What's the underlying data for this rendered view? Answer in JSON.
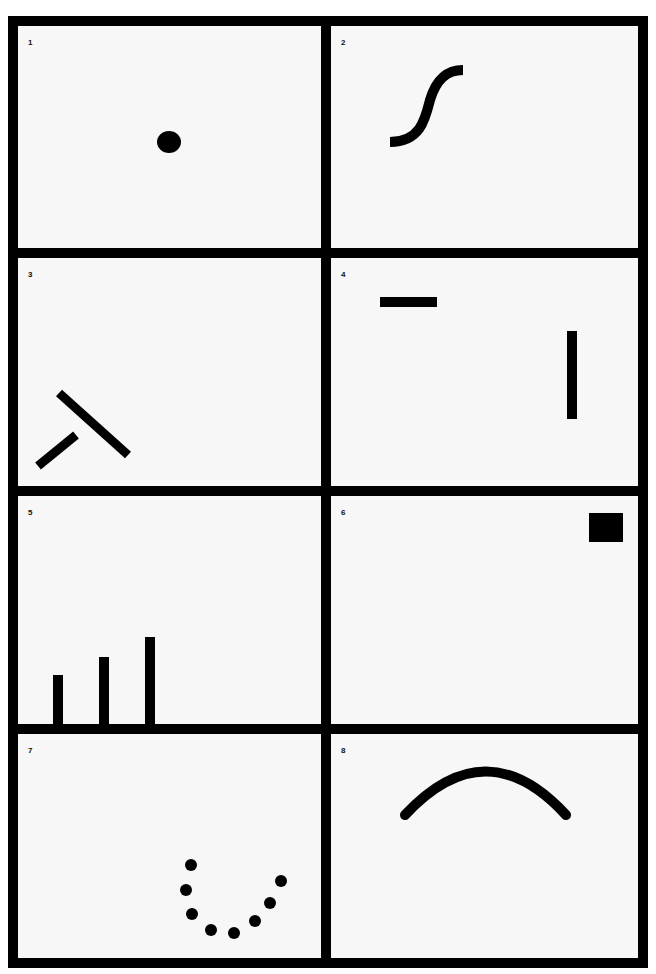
{
  "figure": {
    "background": "#ffffff",
    "frame_color": "#000000",
    "panel_color": "#f7f7f7",
    "ink_color": "#000000"
  },
  "panels": [
    {
      "number": "1",
      "content": "single filled circle (dot) near center"
    },
    {
      "number": "2",
      "content": "S-shaped curved thick line"
    },
    {
      "number": "3",
      "content": "two thick bars forming an inverted T / angled junction"
    },
    {
      "number": "4",
      "content": "short horizontal bar top-left and long vertical bar right"
    },
    {
      "number": "5",
      "content": "three vertical bars of increasing height along bottom edge"
    },
    {
      "number": "6",
      "content": "filled square in top-right corner"
    },
    {
      "number": "7",
      "content": "eight dots arranged in a U-shaped curve"
    },
    {
      "number": "8",
      "content": "thick arched curve (upside-down U)"
    }
  ]
}
